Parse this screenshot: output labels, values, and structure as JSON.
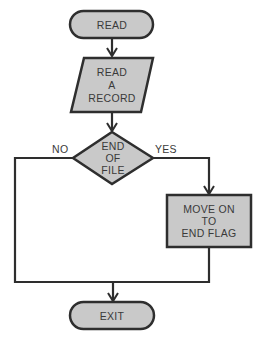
{
  "diagram": {
    "type": "flowchart",
    "colors": {
      "fill": "#c9c9c9",
      "stroke": "#2e2e2e",
      "text": "#3a3a3a",
      "background": "#ffffff"
    },
    "nodes": [
      {
        "id": "read",
        "shape": "terminal",
        "lines": [
          "READ"
        ]
      },
      {
        "id": "read_record",
        "shape": "parallelogram",
        "lines": [
          "READ",
          "A",
          "RECORD"
        ]
      },
      {
        "id": "end_of_file",
        "shape": "diamond",
        "lines": [
          "END",
          "OF",
          "FILE"
        ]
      },
      {
        "id": "move_on",
        "shape": "rectangle",
        "lines": [
          "MOVE ON",
          "TO",
          "END FLAG"
        ]
      },
      {
        "id": "exit",
        "shape": "terminal",
        "lines": [
          "EXIT"
        ]
      }
    ],
    "edges": [
      {
        "from": "read",
        "to": "read_record",
        "label": ""
      },
      {
        "from": "read_record",
        "to": "end_of_file",
        "label": ""
      },
      {
        "from": "end_of_file",
        "to": "exit",
        "label": "NO"
      },
      {
        "from": "end_of_file",
        "to": "move_on",
        "label": "YES"
      },
      {
        "from": "move_on",
        "to": "exit",
        "label": ""
      }
    ]
  }
}
